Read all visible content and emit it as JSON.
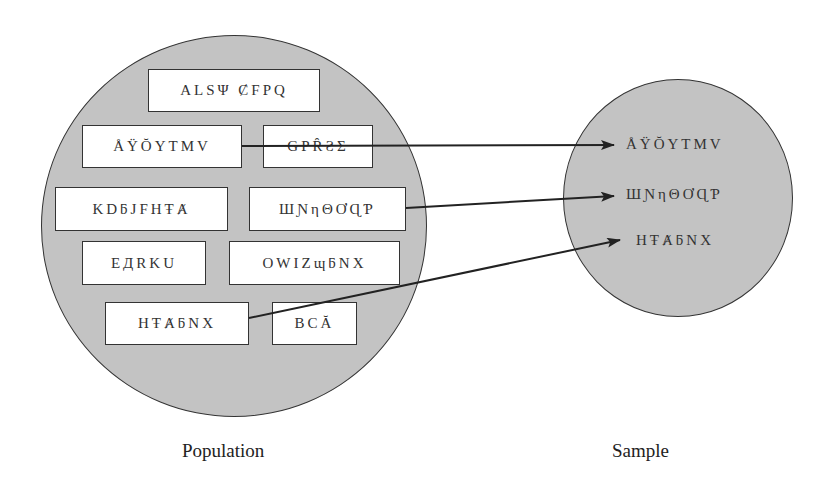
{
  "diagram": {
    "population": {
      "label": "Population",
      "items": [
        {
          "text": "ALSΨ ȻFPQ"
        },
        {
          "text": "ÅŸŎYTMV"
        },
        {
          "text": "GPȒƧΣ"
        },
        {
          "text": "KDƃJFHŦȺ"
        },
        {
          "text": "ШƝηΘƠɊƤ"
        },
        {
          "text": "EДRKU"
        },
        {
          "text": "OWIZɰƃNX"
        },
        {
          "text": "HŦȺƃNX"
        },
        {
          "text": "BCĂ"
        }
      ]
    },
    "sample": {
      "label": "Sample",
      "items": [
        {
          "text": "ÅŸŎYTMV"
        },
        {
          "text": "ШƝηΘƠɊƤ"
        },
        {
          "text": "HŦȺƃNX"
        }
      ]
    },
    "arrows": [
      {
        "from": "ÅŸŎYTMV",
        "to": "ÅŸŎYTMV"
      },
      {
        "from": "ШƝηΘƠɊƤ",
        "to": "ШƝηΘƠɊƤ"
      },
      {
        "from": "HŦȺƃNX",
        "to": "HŦȺƃNX"
      }
    ],
    "colors": {
      "circle_fill": "#c3c3c3",
      "stroke": "#333333",
      "box_fill": "#ffffff",
      "background": "#ffffff"
    }
  }
}
